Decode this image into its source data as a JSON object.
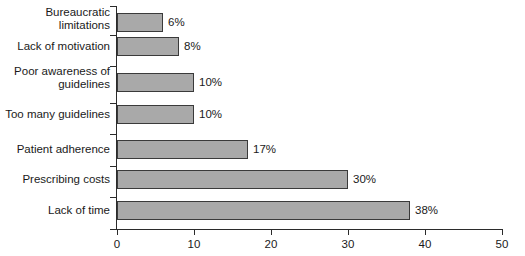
{
  "chart_data": {
    "type": "bar",
    "orientation": "horizontal",
    "title": "",
    "subtitle": "",
    "xlabel": "",
    "ylabel": "",
    "categories": [
      "Bureaucratic limitations",
      "Lack of motivation",
      "Poor awareness of guidelines",
      "Too many guidelines",
      "Patient adherence",
      "Prescribing costs",
      "Lack of time"
    ],
    "values": [
      6,
      8,
      10,
      10,
      17,
      30,
      38
    ],
    "value_labels": [
      "6%",
      "8%",
      "10%",
      "10%",
      "17%",
      "30%",
      "38%"
    ],
    "xlim": [
      0,
      50
    ],
    "xticks": [
      0,
      10,
      20,
      30,
      40,
      50
    ],
    "xtick_labels": [
      "0",
      "10",
      "20",
      "30",
      "40",
      "50"
    ],
    "grid": false,
    "legend": null,
    "bar_fill_color": "#a9a9a9",
    "bar_edge_color": "#3a3a3a",
    "axis_color": "#2b2b2b",
    "background_color": "#ffffff"
  },
  "bars": [
    {
      "label_line1": "Bureaucratic",
      "label_line2": "limitations",
      "value": 6,
      "value_label": "6%"
    },
    {
      "label_line1": "Lack of motivation",
      "label_line2": "",
      "value": 8,
      "value_label": "8%"
    },
    {
      "label_line1": "Poor awareness of",
      "label_line2": "guidelines",
      "value": 10,
      "value_label": "10%"
    },
    {
      "label_line1": "Too many guidelines",
      "label_line2": "",
      "value": 10,
      "value_label": "10%"
    },
    {
      "label_line1": "Patient adherence",
      "label_line2": "",
      "value": 17,
      "value_label": "17%"
    },
    {
      "label_line1": "Prescribing costs",
      "label_line2": "",
      "value": 30,
      "value_label": "30%"
    },
    {
      "label_line1": "Lack of time",
      "label_line2": "",
      "value": 38,
      "value_label": "38%"
    }
  ],
  "axis": {
    "ticks": [
      {
        "label": "0"
      },
      {
        "label": "10"
      },
      {
        "label": "20"
      },
      {
        "label": "30"
      },
      {
        "label": "40"
      },
      {
        "label": "50"
      }
    ]
  }
}
